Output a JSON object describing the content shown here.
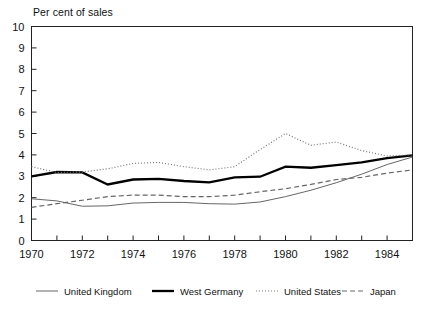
{
  "chart_data": {
    "type": "line",
    "title": "Per cent of sales",
    "xlabel": "",
    "ylabel": "Per cent of sales",
    "xlim": [
      1970,
      1985
    ],
    "ylim": [
      0,
      10
    ],
    "ytick_step": 1,
    "yticks": [
      0,
      1,
      2,
      3,
      4,
      5,
      6,
      7,
      8,
      9,
      10
    ],
    "ytick_labels": [
      "0",
      "1",
      "2",
      "3",
      "4",
      "5",
      "6",
      "7",
      "8",
      "9",
      "10"
    ],
    "xticks": [
      1970,
      1971,
      1972,
      1973,
      1974,
      1975,
      1976,
      1977,
      1978,
      1979,
      1980,
      1981,
      1982,
      1983,
      1984,
      1985
    ],
    "xtick_labels": [
      "1970",
      "",
      "1972",
      "",
      "1974",
      "",
      "1976",
      "",
      "1978",
      "",
      "1980",
      "",
      "1982",
      "",
      "1984",
      ""
    ],
    "xtick_labels_shown": [
      "1970",
      "1972",
      "1974",
      "1976",
      "1978",
      "1980",
      "1982",
      "1984"
    ],
    "grid": false,
    "legend_position": "bottom",
    "x": [
      1970,
      1971,
      1972,
      1973,
      1974,
      1975,
      1976,
      1977,
      1978,
      1979,
      1980,
      1981,
      1982,
      1983,
      1984,
      1985
    ],
    "series": [
      {
        "name": "United Kingdom",
        "style": "solid-thin",
        "color": "#555555",
        "values": [
          1.95,
          1.85,
          1.6,
          1.62,
          1.75,
          1.78,
          1.78,
          1.72,
          1.7,
          1.8,
          2.05,
          2.35,
          2.7,
          3.1,
          3.55,
          3.9
        ]
      },
      {
        "name": "West Germany",
        "style": "solid-thick",
        "color": "#000000",
        "values": [
          3.0,
          3.2,
          3.18,
          2.62,
          2.85,
          2.88,
          2.78,
          2.72,
          2.95,
          2.98,
          3.45,
          3.4,
          3.52,
          3.65,
          3.85,
          3.98
        ]
      },
      {
        "name": "United States",
        "style": "dotted",
        "color": "#777777",
        "values": [
          3.45,
          3.18,
          3.2,
          3.35,
          3.6,
          3.65,
          3.45,
          3.3,
          3.45,
          4.25,
          5.0,
          4.45,
          4.6,
          4.2,
          3.95,
          4.0
        ]
      },
      {
        "name": "Japan",
        "style": "dashed",
        "color": "#666666",
        "values": [
          1.55,
          1.72,
          1.88,
          2.05,
          2.12,
          2.12,
          2.05,
          2.05,
          2.12,
          2.28,
          2.42,
          2.62,
          2.85,
          2.95,
          3.15,
          3.3
        ]
      }
    ]
  },
  "legend": {
    "items": [
      {
        "label": "United Kingdom",
        "key": "united-kingdom"
      },
      {
        "label": "West Germany",
        "key": "west-germany"
      },
      {
        "label": "United States",
        "key": "united-states"
      },
      {
        "label": "Japan",
        "key": "japan"
      }
    ]
  }
}
